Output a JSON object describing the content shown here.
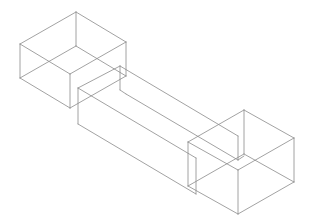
{
  "diagram": {
    "type": "isometric-wireframe",
    "stroke_color": "#8a8a8a",
    "background": "#ffffff",
    "shapes": [
      {
        "name": "left-box",
        "lines": [
          [
            76,
            12,
            20,
            44
          ],
          [
            76,
            12,
            126,
            42
          ],
          [
            20,
            44,
            70,
            74
          ],
          [
            126,
            42,
            70,
            74
          ],
          [
            20,
            44,
            20,
            78
          ],
          [
            70,
            74,
            70,
            108
          ],
          [
            126,
            42,
            126,
            76
          ],
          [
            20,
            78,
            70,
            108
          ],
          [
            70,
            108,
            126,
            76
          ],
          [
            76,
            12,
            76,
            46
          ],
          [
            76,
            46,
            20,
            78
          ],
          [
            76,
            46,
            126,
            76
          ]
        ]
      },
      {
        "name": "beam",
        "lines": [
          [
            78,
            88,
            120,
            66
          ],
          [
            120,
            66,
            120,
            90
          ],
          [
            120,
            90,
            126,
            94
          ],
          [
            78,
            88,
            78,
            124
          ],
          [
            78,
            88,
            196,
            158
          ],
          [
            120,
            66,
            238,
            136
          ],
          [
            126,
            94,
            238,
            160
          ],
          [
            78,
            124,
            196,
            194
          ],
          [
            196,
            158,
            196,
            194
          ]
        ]
      },
      {
        "name": "right-box",
        "lines": [
          [
            244,
            110,
            188,
            142
          ],
          [
            244,
            110,
            294,
            138
          ],
          [
            188,
            142,
            238,
            170
          ],
          [
            294,
            138,
            238,
            170
          ],
          [
            188,
            142,
            188,
            186
          ],
          [
            238,
            170,
            238,
            214
          ],
          [
            294,
            138,
            294,
            182
          ],
          [
            188,
            186,
            238,
            214
          ],
          [
            238,
            214,
            294,
            182
          ],
          [
            244,
            110,
            244,
            154
          ],
          [
            244,
            154,
            188,
            186
          ],
          [
            244,
            154,
            294,
            182
          ],
          [
            238,
            136,
            238,
            160
          ],
          [
            238,
            160,
            244,
            156
          ]
        ]
      }
    ]
  }
}
